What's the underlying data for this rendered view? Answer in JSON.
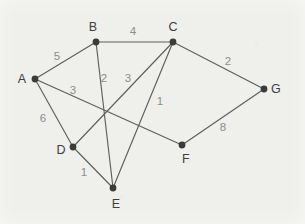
{
  "diagram": {
    "background_color": "#efefec",
    "node_color": "#3b3b3b",
    "edge_color": "#5e5e5e",
    "weight_color": "#8d8d8d",
    "label_color": "#3d3d3d",
    "nodes": [
      {
        "id": "A",
        "label": "A",
        "x": 35,
        "y": 79,
        "label_x": 22,
        "label_y": 79
      },
      {
        "id": "B",
        "label": "B",
        "x": 96,
        "y": 42,
        "label_x": 93,
        "label_y": 27
      },
      {
        "id": "C",
        "label": "C",
        "x": 173,
        "y": 42,
        "label_x": 173,
        "label_y": 27
      },
      {
        "id": "D",
        "label": "D",
        "x": 73,
        "y": 147,
        "label_x": 61,
        "label_y": 150
      },
      {
        "id": "E",
        "label": "E",
        "x": 113,
        "y": 188,
        "label_x": 116,
        "label_y": 204
      },
      {
        "id": "F",
        "label": "F",
        "x": 182,
        "y": 145,
        "label_x": 186,
        "label_y": 159
      },
      {
        "id": "G",
        "label": "G",
        "x": 264,
        "y": 89,
        "label_x": 276,
        "label_y": 89
      }
    ],
    "edges": [
      {
        "from": "A",
        "to": "B",
        "weight": "5",
        "label_x": 57,
        "label_y": 56
      },
      {
        "from": "A",
        "to": "D",
        "weight": "6",
        "label_x": 43,
        "label_y": 118
      },
      {
        "from": "A",
        "to": "F",
        "weight": "3",
        "label_x": 73,
        "label_y": 90
      },
      {
        "from": "B",
        "to": "C",
        "weight": "4",
        "label_x": 133,
        "label_y": 31
      },
      {
        "from": "B",
        "to": "E",
        "weight": "2",
        "label_x": 104,
        "label_y": 78
      },
      {
        "from": "C",
        "to": "D",
        "weight": "3",
        "label_x": 128,
        "label_y": 78
      },
      {
        "from": "C",
        "to": "E",
        "weight": "1",
        "label_x": 160,
        "label_y": 101
      },
      {
        "from": "C",
        "to": "G",
        "weight": "2",
        "label_x": 228,
        "label_y": 61
      },
      {
        "from": "D",
        "to": "E",
        "weight": "1",
        "label_x": 84,
        "label_y": 172
      },
      {
        "from": "F",
        "to": "G",
        "weight": "8",
        "label_x": 223,
        "label_y": 127
      }
    ]
  }
}
